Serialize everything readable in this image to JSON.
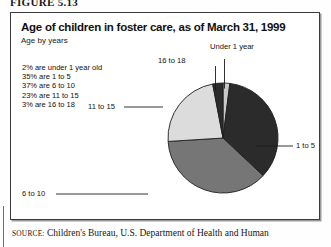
{
  "figure": {
    "number": "FIGURE 5.13",
    "title": "Age of children in foster care, as of March 31, 1999",
    "subtitle": "Age by years"
  },
  "stats": {
    "lines": [
      "2% are under 1 year old",
      "35% are 1 to 5",
      "37% are 6 to 10",
      "23% are 11 to 15",
      "3% are 16 to 18"
    ]
  },
  "labels": {
    "under_1": "Under 1 year",
    "age_16_18": "16 to 18",
    "age_11_15": "11 to 15",
    "age_6_10": "6 to 10",
    "age_1_5": "1 to 5"
  },
  "source": {
    "prefix": "SOURCE:",
    "text": "Children's Bureau, U.S. Department of Health and Human"
  },
  "colors": {
    "under_1": "#c9c9c9",
    "age_1_5": "#2b2b2b",
    "age_6_10": "#767676",
    "age_11_15": "#dcdcdc",
    "age_16_18": "#2b2b2b",
    "outline": "#1e1e1e",
    "frame": "#3b3b3b"
  },
  "chart_data": {
    "type": "pie",
    "title": "Age of children in foster care, as of March 31, 1999",
    "subtitle": "Age by years",
    "categories": [
      "Under 1 year",
      "1 to 5",
      "6 to 10",
      "11 to 15",
      "16 to 18"
    ],
    "values": [
      2,
      35,
      37,
      23,
      3
    ],
    "unit": "percent",
    "start_angle_deg": 0,
    "direction": "clockwise",
    "legend": "none-labels-with-leader-lines",
    "slice_colors": [
      "#c9c9c9",
      "#2b2b2b",
      "#767676",
      "#dcdcdc",
      "#2b2b2b"
    ]
  }
}
